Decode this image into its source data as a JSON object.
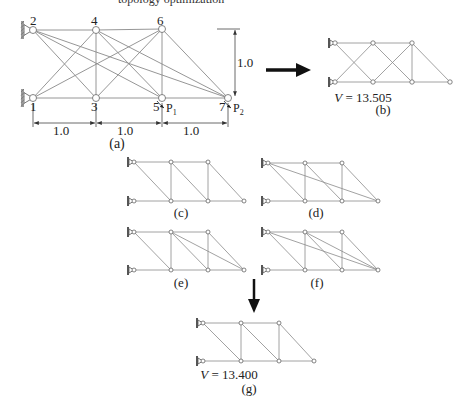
{
  "figure": {
    "top_cropped_text": "topology optimization",
    "panel_a": {
      "label": "(a)",
      "node_labels": [
        {
          "id": "1",
          "x": 30,
          "y": 100
        },
        {
          "id": "2",
          "x": 30,
          "y": 14
        },
        {
          "id": "3",
          "x": 91,
          "y": 100
        },
        {
          "id": "4",
          "x": 91,
          "y": 14
        },
        {
          "id": "5",
          "x": 153,
          "y": 100
        },
        {
          "id": "6",
          "x": 157,
          "y": 14
        },
        {
          "id": "7",
          "x": 219,
          "y": 100
        }
      ],
      "loads": [
        {
          "label": "P1",
          "sub": "1",
          "x": 166,
          "y": 103
        },
        {
          "label": "P2",
          "sub": "2",
          "x": 233,
          "y": 103
        }
      ],
      "dimensions": {
        "horizontal": [
          "1.0",
          "1.0",
          "1.0"
        ],
        "vertical": "1.0"
      }
    },
    "panel_b": {
      "label": "(b)",
      "volume_text": "V = 13.505",
      "volume_value": 13.505
    },
    "panel_c": {
      "label": "(c)"
    },
    "panel_d": {
      "label": "(d)"
    },
    "panel_e": {
      "label": "(e)"
    },
    "panel_f": {
      "label": "(f)"
    },
    "panel_g": {
      "label": "(g)",
      "volume_text": "V = 13.400",
      "volume_value": 13.4
    },
    "colors": {
      "member": "#8a8a8a",
      "node_fill": "#ffffff",
      "node_stroke": "#666666",
      "arrow": "#111111",
      "text": "#222222",
      "support": "#555555"
    }
  },
  "trusses": {
    "a": {
      "nodes": {
        "1": [
          33,
          98
        ],
        "2": [
          33,
          30
        ],
        "3": [
          96,
          98
        ],
        "4": [
          96,
          30
        ],
        "5": [
          162,
          98
        ],
        "6": [
          162,
          29
        ],
        "7": [
          228,
          98
        ]
      },
      "members": [
        [
          "1",
          "3"
        ],
        [
          "3",
          "5"
        ],
        [
          "5",
          "7"
        ],
        [
          "2",
          "4"
        ],
        [
          "4",
          "6"
        ],
        [
          "3",
          "4"
        ],
        [
          "5",
          "6"
        ],
        [
          "1",
          "4"
        ],
        [
          "1",
          "6"
        ],
        [
          "2",
          "3"
        ],
        [
          "2",
          "5"
        ],
        [
          "2",
          "7"
        ],
        [
          "3",
          "6"
        ],
        [
          "4",
          "5"
        ],
        [
          "4",
          "7"
        ],
        [
          "6",
          "7"
        ]
      ],
      "node_r": 3.5
    },
    "b": {
      "nodes": {
        "1": [
          335,
          82
        ],
        "2": [
          335,
          43
        ],
        "3": [
          373,
          82
        ],
        "4": [
          373,
          43
        ],
        "5": [
          412,
          82
        ],
        "6": [
          412,
          43
        ],
        "7": [
          450,
          82
        ]
      },
      "members": [
        [
          "2",
          "4"
        ],
        [
          "4",
          "6"
        ],
        [
          "1",
          "3"
        ],
        [
          "3",
          "5"
        ],
        [
          "5",
          "7"
        ],
        [
          "2",
          "3"
        ],
        [
          "1",
          "4"
        ],
        [
          "4",
          "5"
        ],
        [
          "3",
          "6"
        ],
        [
          "5",
          "6"
        ],
        [
          "6",
          "7"
        ]
      ],
      "node_r": 2.2
    },
    "c": {
      "nodes": {
        "1": [
          134,
          201
        ],
        "2": [
          134,
          162
        ],
        "3": [
          171,
          201
        ],
        "4": [
          171,
          162
        ],
        "5": [
          208,
          201
        ],
        "6": [
          208,
          162
        ],
        "7": [
          244,
          201
        ]
      },
      "members": [
        [
          "2",
          "4"
        ],
        [
          "4",
          "6"
        ],
        [
          "1",
          "3"
        ],
        [
          "3",
          "5"
        ],
        [
          "5",
          "7"
        ],
        [
          "2",
          "3"
        ],
        [
          "3",
          "4"
        ],
        [
          "4",
          "5"
        ],
        [
          "5",
          "6"
        ],
        [
          "6",
          "7"
        ]
      ],
      "node_r": 2
    },
    "d": {
      "nodes": {
        "1": [
          268,
          201
        ],
        "2": [
          268,
          163
        ],
        "3": [
          305,
          201
        ],
        "4": [
          305,
          163
        ],
        "5": [
          342,
          201
        ],
        "6": [
          342,
          163
        ],
        "7": [
          378,
          201
        ]
      },
      "members": [
        [
          "2",
          "4"
        ],
        [
          "4",
          "6"
        ],
        [
          "1",
          "3"
        ],
        [
          "3",
          "5"
        ],
        [
          "5",
          "7"
        ],
        [
          "2",
          "3"
        ],
        [
          "3",
          "4"
        ],
        [
          "4",
          "5"
        ],
        [
          "5",
          "6"
        ],
        [
          "6",
          "7"
        ],
        [
          "2",
          "7"
        ]
      ],
      "node_r": 2
    },
    "e": {
      "nodes": {
        "1": [
          134,
          270
        ],
        "2": [
          134,
          232
        ],
        "3": [
          171,
          270
        ],
        "4": [
          171,
          232
        ],
        "5": [
          208,
          270
        ],
        "6": [
          208,
          232
        ],
        "7": [
          244,
          270
        ]
      },
      "members": [
        [
          "2",
          "4"
        ],
        [
          "4",
          "6"
        ],
        [
          "1",
          "3"
        ],
        [
          "3",
          "5"
        ],
        [
          "5",
          "7"
        ],
        [
          "2",
          "3"
        ],
        [
          "3",
          "4"
        ],
        [
          "4",
          "5"
        ],
        [
          "5",
          "6"
        ],
        [
          "6",
          "7"
        ],
        [
          "4",
          "7"
        ]
      ],
      "node_r": 2
    },
    "f": {
      "nodes": {
        "1": [
          268,
          270
        ],
        "2": [
          268,
          232
        ],
        "3": [
          305,
          270
        ],
        "4": [
          305,
          232
        ],
        "5": [
          342,
          270
        ],
        "6": [
          342,
          232
        ],
        "7": [
          378,
          270
        ]
      },
      "members": [
        [
          "2",
          "4"
        ],
        [
          "4",
          "6"
        ],
        [
          "1",
          "3"
        ],
        [
          "3",
          "5"
        ],
        [
          "5",
          "7"
        ],
        [
          "2",
          "3"
        ],
        [
          "3",
          "4"
        ],
        [
          "4",
          "5"
        ],
        [
          "5",
          "6"
        ],
        [
          "6",
          "7"
        ],
        [
          "2",
          "7"
        ],
        [
          "4",
          "7"
        ]
      ],
      "node_r": 2
    },
    "g": {
      "nodes": {
        "1": [
          203,
          361
        ],
        "2": [
          203,
          323
        ],
        "3": [
          241,
          361
        ],
        "4": [
          241,
          323
        ],
        "5": [
          279,
          361
        ],
        "6": [
          279,
          323
        ],
        "7": [
          314,
          361
        ]
      },
      "members": [
        [
          "2",
          "4"
        ],
        [
          "4",
          "6"
        ],
        [
          "1",
          "3"
        ],
        [
          "3",
          "5"
        ],
        [
          "5",
          "7"
        ],
        [
          "2",
          "3"
        ],
        [
          "3",
          "4"
        ],
        [
          "4",
          "5"
        ],
        [
          "5",
          "6"
        ],
        [
          "6",
          "7"
        ]
      ],
      "node_r": 2
    }
  },
  "labels": [
    {
      "key": "figure.panel_a.label",
      "x": 117,
      "y": 137,
      "size": 14,
      "name": "panel-a-caption"
    },
    {
      "key": "figure.panel_b.volume_text",
      "x": 363,
      "y": 91,
      "size": 13,
      "name": "panel-b-volume",
      "italicV": true
    },
    {
      "key": "figure.panel_b.label",
      "x": 383,
      "y": 103,
      "size": 13,
      "name": "panel-b-caption"
    },
    {
      "key": "figure.panel_c.label",
      "x": 181,
      "y": 206,
      "size": 13,
      "name": "panel-c-caption"
    },
    {
      "key": "figure.panel_d.label",
      "x": 316,
      "y": 206,
      "size": 13,
      "name": "panel-d-caption"
    },
    {
      "key": "figure.panel_e.label",
      "x": 181,
      "y": 276,
      "size": 13,
      "name": "panel-e-caption"
    },
    {
      "key": "figure.panel_f.label",
      "x": 317,
      "y": 276,
      "size": 13,
      "name": "panel-f-caption"
    },
    {
      "key": "figure.panel_g.volume_text",
      "x": 229,
      "y": 368,
      "size": 13,
      "name": "panel-g-volume",
      "italicV": true
    },
    {
      "key": "figure.panel_g.label",
      "x": 249,
      "y": 382,
      "size": 13,
      "name": "panel-g-caption"
    }
  ]
}
